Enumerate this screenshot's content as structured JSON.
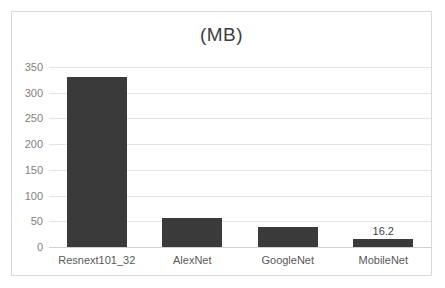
{
  "chart_data": {
    "type": "bar",
    "title": "(MB)",
    "xlabel": "",
    "ylabel": "",
    "categories": [
      "Resnext101_32",
      "AlexNet",
      "GoogleNet",
      "MobileNet"
    ],
    "values": [
      330,
      56,
      39,
      16.2
    ],
    "point_labels": [
      "",
      "",
      "",
      "16.2"
    ],
    "ylim": [
      0,
      350
    ],
    "yticks": [
      0,
      50,
      100,
      150,
      200,
      250,
      300,
      350
    ],
    "ytick_labels": [
      "0",
      "50",
      "100",
      "150",
      "200",
      "250",
      "300",
      "350"
    ],
    "grid": true,
    "legend": false,
    "legend_position": "none",
    "colors": {
      "bar": "#3a3a3a",
      "gridline": "#e4e4e4",
      "baseline": "#d0d0d0",
      "frame_border": "#d9d9d9",
      "tick_label": "#808080",
      "category_label": "#595959",
      "title": "#404040",
      "data_label": "#3f3f3f",
      "background": "#ffffff"
    }
  }
}
